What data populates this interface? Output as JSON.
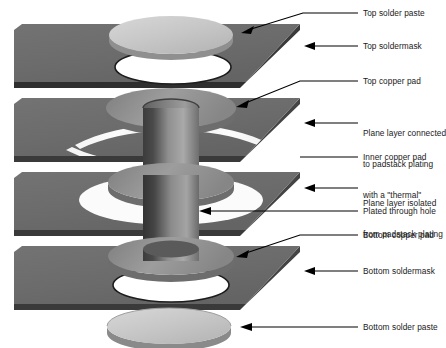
{
  "colors": {
    "background": "#ffffff",
    "board_layer": "#6e6e6e",
    "board_layer_dark": "#595959",
    "board_edge_dark": "#2d2d2d",
    "copper_pad": "#8c8c8c",
    "copper_pad_top": "#9a9a9a",
    "solder_paste": "#c9c9c9",
    "solder_paste_edge": "#8a8a8a",
    "barrel_dark": "#3a3a3a",
    "barrel_light": "#a8a8a8",
    "hole_void": "#ffffff",
    "leader_line": "#000000",
    "text": "#1a1a1a"
  },
  "labels": [
    {
      "id": "top-solder-paste",
      "text": "Top solder paste",
      "x": 363,
      "y": 10,
      "lines": [
        "Top solder paste"
      ]
    },
    {
      "id": "top-soldermask",
      "text": "Top soldermask",
      "x": 363,
      "y": 43,
      "lines": [
        "Top soldermask"
      ]
    },
    {
      "id": "top-copper-pad",
      "text": "Top copper pad",
      "x": 363,
      "y": 78,
      "lines": [
        "Top copper pad"
      ]
    },
    {
      "id": "plane-layer-thermal",
      "text": "Plane layer connected to padstack plating with a \"thermal\"",
      "x": 363,
      "y": 110,
      "lines": [
        "Plane layer connected",
        "to padstack plating",
        "with a \"thermal\""
      ]
    },
    {
      "id": "inner-copper-pad",
      "text": "Inner copper pad",
      "x": 363,
      "y": 154,
      "lines": [
        "Inner copper pad"
      ]
    },
    {
      "id": "plane-layer-isolated",
      "text": "Plane layer isolated from padstack plating",
      "x": 363,
      "y": 181,
      "lines": [
        "Plane layer isolated",
        "from padstack plating"
      ]
    },
    {
      "id": "plated-through-hole",
      "text": "Plated through hole",
      "x": 363,
      "y": 208,
      "lines": [
        "Plated through hole"
      ]
    },
    {
      "id": "bottom-copper-pad",
      "text": "Bottom copper pad",
      "x": 363,
      "y": 232,
      "lines": [
        "Bottom copper pad"
      ]
    },
    {
      "id": "bottom-soldermask",
      "text": "Bottom soldermask",
      "x": 363,
      "y": 268,
      "lines": [
        "Bottom soldermask"
      ]
    },
    {
      "id": "bottom-solder-paste",
      "text": "Bottom solder paste",
      "x": 363,
      "y": 324,
      "lines": [
        "Bottom solder paste"
      ]
    }
  ],
  "layers": [
    {
      "id": "top-soldermask-slab",
      "name": "Top soldermask",
      "order": 1
    },
    {
      "id": "top-copper-plane-slab",
      "name": "Top copper plane",
      "order": 2
    },
    {
      "id": "inner-plane-slab",
      "name": "Inner plane layer",
      "order": 3
    },
    {
      "id": "bottom-soldermask-slab",
      "name": "Bottom soldermask",
      "order": 4
    }
  ],
  "features": [
    {
      "id": "top-solder-paste-disc",
      "name": "Top solder paste disc"
    },
    {
      "id": "top-copper-pad-annulus",
      "name": "Top copper pad annulus"
    },
    {
      "id": "inner-copper-pad-annulus",
      "name": "Inner copper pad annulus"
    },
    {
      "id": "bottom-copper-pad-annulus",
      "name": "Bottom copper pad annulus"
    },
    {
      "id": "thermal-relief-spokes",
      "name": "Thermal relief spokes"
    },
    {
      "id": "antipad-clearance",
      "name": "Antipad clearance void"
    },
    {
      "id": "plating-barrel",
      "name": "Plated through hole barrel"
    },
    {
      "id": "bottom-solder-paste-disc",
      "name": "Bottom solder paste disc"
    }
  ]
}
